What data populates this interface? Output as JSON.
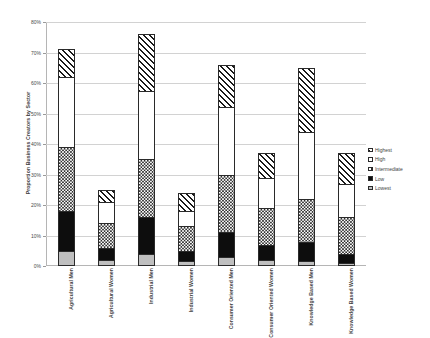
{
  "chart_data": {
    "type": "bar",
    "subtype": "stacked-column",
    "title": "",
    "xlabel": "",
    "ylabel": "Proportion Business Creators by Sector",
    "ylim": [
      0,
      80
    ],
    "ytick_labels": [
      "0%",
      "10%",
      "20%",
      "30%",
      "40%",
      "50%",
      "60%",
      "70%",
      "80%"
    ],
    "ytick_values": [
      0,
      10,
      20,
      30,
      40,
      50,
      60,
      70,
      80
    ],
    "grid": true,
    "legend_position": "right",
    "stack_order_bottom_to_top": [
      "Lowest",
      "Low",
      "Intermediate",
      "High",
      "Highest"
    ],
    "categories": [
      "Agricultural Men",
      "Agricultural Women",
      "Industrial Men",
      "Industrial Women",
      "Consumer Oriented Men",
      "Consumer Oriented Women",
      "Knowledge Based Men",
      "Knowledge Based Women"
    ],
    "series": [
      {
        "name": "Lowest",
        "pattern": "light-grey-solid",
        "values": [
          5.0,
          2.0,
          4.0,
          1.5,
          3.0,
          2.0,
          1.5,
          1.0
        ]
      },
      {
        "name": "Low",
        "pattern": "black-solid",
        "values": [
          13.0,
          4.0,
          12.0,
          3.5,
          8.0,
          5.0,
          6.5,
          3.0
        ]
      },
      {
        "name": "Intermediate",
        "pattern": "checkerboard",
        "values": [
          21.0,
          8.0,
          19.0,
          8.0,
          19.0,
          12.0,
          14.0,
          12.0
        ]
      },
      {
        "name": "High",
        "pattern": "white-solid",
        "values": [
          23.0,
          7.0,
          22.5,
          5.0,
          22.0,
          10.0,
          22.0,
          11.0
        ]
      },
      {
        "name": "Highest",
        "pattern": "diagonal-hatch",
        "values": [
          9.0,
          4.0,
          18.5,
          6.0,
          14.0,
          8.0,
          21.0,
          10.0
        ]
      }
    ],
    "totals": [
      71.0,
      25.0,
      76.0,
      24.0,
      66.0,
      37.0,
      65.0,
      37.0
    ]
  },
  "legend": {
    "items": [
      {
        "label": "Highest",
        "swatch": "diagonal-hatch"
      },
      {
        "label": "High",
        "swatch": "white-solid"
      },
      {
        "label": "Intermediate",
        "swatch": "checkerboard"
      },
      {
        "label": "Low",
        "swatch": "black-solid"
      },
      {
        "label": "Lowest",
        "swatch": "light-grey-solid"
      }
    ]
  }
}
